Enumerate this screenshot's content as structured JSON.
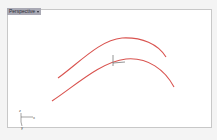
{
  "viewport": {
    "title": "Perspective",
    "dropdown_icon": "chevron-down-icon",
    "background": "#ffffff",
    "border_color": "#c8c8c8"
  },
  "scene": {
    "curve_color": "#d9534f",
    "curves": [
      {
        "name": "upper-curve",
        "path": "M58 78 C 80 62, 100 40, 122 38 C 142 37, 158 44, 166 57"
      },
      {
        "name": "lower-curve",
        "path": "M52 101 C 75 86, 100 62, 126 59 C 148 57, 165 70, 174 87"
      }
    ],
    "gumball": {
      "color": "#7a7a7a",
      "vertical": {
        "x1": 113,
        "y1": 55,
        "x2": 113,
        "y2": 66
      },
      "horizontal": {
        "x1": 113,
        "y1": 63,
        "x2": 125,
        "y2": 62
      }
    },
    "axis_widget": {
      "x_label": "x",
      "y_label": "y",
      "z_label": "z"
    }
  }
}
